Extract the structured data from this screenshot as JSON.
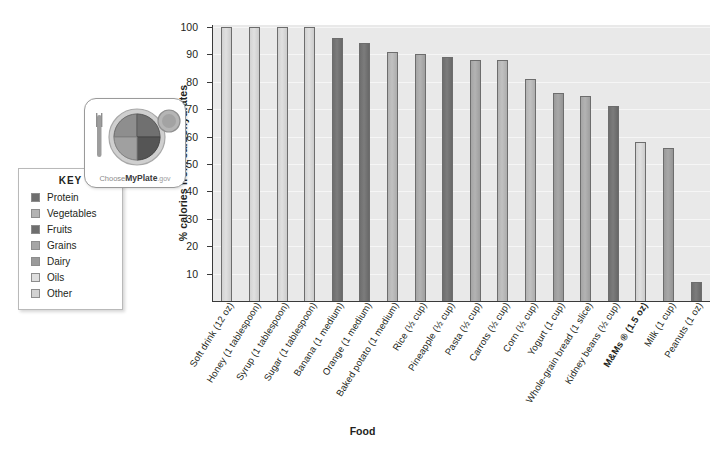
{
  "chart_data": {
    "type": "bar",
    "title": "",
    "xlabel": "Food",
    "ylabel": "% calories from carbohydrates",
    "ylim": [
      0,
      100
    ],
    "yticks": [
      10,
      20,
      30,
      40,
      50,
      60,
      70,
      80,
      90,
      100
    ],
    "grid": true,
    "legend_position": "left",
    "categories": [
      "Soft drink (12 oz)",
      "Honey (1 tablespoon)",
      "Syrup (1 tablespoon)",
      "Sugar (1 tablespoon)",
      "Banana (1 medium)",
      "Orange (1 medium)",
      "Baked potato (1 medium)",
      "Rice (½ cup)",
      "Pineapple (½ cup)",
      "Pasta (½ cup)",
      "Carrots (½ cup)",
      "Corn (½ cup)",
      "Yogurt (1 cup)",
      "Whole-grain bread (1 slice)",
      "Kidney beans (½ cup)",
      "M&Ms ® (1.5 oz)",
      "Milk (1 cup)",
      "Peanuts (1 oz)"
    ],
    "values": [
      100,
      100,
      100,
      100,
      96,
      94,
      91,
      90,
      89,
      88,
      88,
      81,
      76,
      75,
      71,
      58,
      56,
      7
    ],
    "group": [
      "Other",
      "Other",
      "Other",
      "Other",
      "Fruits",
      "Fruits",
      "Vegetables",
      "Grains",
      "Fruits",
      "Grains",
      "Vegetables",
      "Vegetables",
      "Dairy",
      "Grains",
      "Protein",
      "Other",
      "Dairy",
      "Protein"
    ],
    "bold_labels": [
      "M&Ms ® (1.5 oz)"
    ]
  },
  "key": {
    "title": "KEY",
    "items": [
      {
        "label": "Protein",
        "color": "#6e6e6e"
      },
      {
        "label": "Vegetables",
        "color": "#b3b3b3"
      },
      {
        "label": "Fruits",
        "color": "#6e6e6e"
      },
      {
        "label": "Grains",
        "color": "#a5a5a5"
      },
      {
        "label": "Dairy",
        "color": "#9a9a9a"
      },
      {
        "label": "Oils",
        "color": "#dedede"
      },
      {
        "label": "Other",
        "color": "#d2d2d2"
      }
    ]
  },
  "logo": {
    "name": "myplate-logo",
    "caption_light": "Choose",
    "caption_bold": "MyPlate",
    "caption_gov": ".gov"
  },
  "colors": {
    "plot_background": "#e9e9e9",
    "gridline": "#f6f6f6",
    "axis": "#3a3a3a",
    "bar_outline": "#6d6d6d",
    "text": "#231f20"
  }
}
